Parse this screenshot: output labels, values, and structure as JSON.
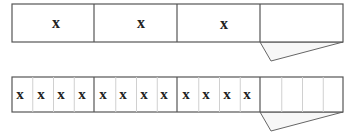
{
  "diagram": {
    "top_bar": {
      "segments": [
        "x",
        "x",
        "x",
        ""
      ],
      "folded_segment_index": 3
    },
    "bottom_bar": {
      "groups": [
        [
          "x",
          "x",
          "x",
          "x"
        ],
        [
          "x",
          "x",
          "x",
          "x"
        ],
        [
          "x",
          "x",
          "x",
          "x"
        ],
        [
          "",
          "",
          "",
          ""
        ]
      ],
      "folded_group_index": 3
    },
    "colors": {
      "stroke": "#555555",
      "sub_divider": "#d0d0d0",
      "fold_fill": "#f7f7f7",
      "text": "#222222"
    }
  }
}
